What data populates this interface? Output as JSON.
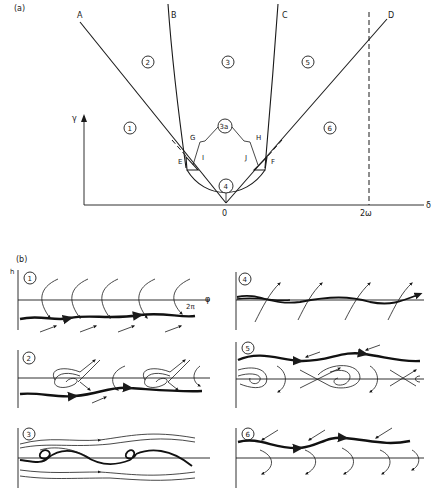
{
  "figure": {
    "panel_a": {
      "label": "(a)",
      "x_axis_label": "δ",
      "y_axis_label": "γ",
      "x_ticks": [
        "0",
        "2ω"
      ],
      "curve_labels": [
        "A",
        "B",
        "C",
        "D"
      ],
      "point_labels": [
        "E",
        "F",
        "G",
        "H",
        "I",
        "J"
      ],
      "regions": [
        "1",
        "2",
        "3",
        "3a",
        "4",
        "5",
        "6"
      ]
    },
    "panel_b": {
      "label": "(b)",
      "y_axis_label": "h",
      "x_axis_label": "φ",
      "x_tick": "2π",
      "subplots": [
        {
          "id": "1",
          "label": "1"
        },
        {
          "id": "2",
          "label": "2"
        },
        {
          "id": "3",
          "label": "3"
        },
        {
          "id": "4",
          "label": "4"
        },
        {
          "id": "5",
          "label": "5"
        },
        {
          "id": "6",
          "label": "6"
        }
      ]
    }
  }
}
